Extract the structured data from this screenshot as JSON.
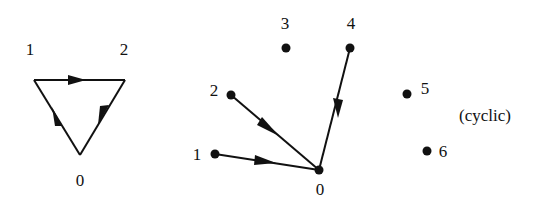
{
  "diagram": {
    "left_graph": {
      "nodes": [
        {
          "id": "0",
          "label": "0",
          "x": 80,
          "y": 155,
          "lx": 80,
          "ly": 186
        },
        {
          "id": "1",
          "label": "1",
          "x": 34,
          "y": 80,
          "lx": 30,
          "ly": 55
        },
        {
          "id": "2",
          "label": "2",
          "x": 125,
          "y": 80,
          "lx": 124,
          "ly": 55
        }
      ],
      "edges": [
        {
          "from": "1",
          "to": "2"
        },
        {
          "from": "2",
          "to": "0"
        },
        {
          "from": "0",
          "to": "1"
        }
      ]
    },
    "right_graph": {
      "nodes": [
        {
          "id": "0",
          "label": "0",
          "x": 319,
          "y": 170,
          "lx": 320,
          "ly": 195
        },
        {
          "id": "1",
          "label": "1",
          "x": 215,
          "y": 154,
          "lx": 197,
          "ly": 160
        },
        {
          "id": "2",
          "label": "2",
          "x": 231,
          "y": 95,
          "lx": 214,
          "ly": 96
        },
        {
          "id": "3",
          "label": "3",
          "x": 286,
          "y": 48,
          "lx": 285,
          "ly": 29
        },
        {
          "id": "4",
          "label": "4",
          "x": 350,
          "y": 48,
          "lx": 351,
          "ly": 29
        },
        {
          "id": "5",
          "label": "5",
          "x": 407,
          "y": 94,
          "lx": 425,
          "ly": 94
        },
        {
          "id": "6",
          "label": "6",
          "x": 427,
          "y": 151,
          "lx": 443,
          "ly": 152
        }
      ],
      "edges": [
        {
          "from": "1",
          "to": "0"
        },
        {
          "from": "2",
          "to": "0"
        },
        {
          "from": "4",
          "to": "0"
        }
      ],
      "annotation": "(cyclic)"
    }
  }
}
